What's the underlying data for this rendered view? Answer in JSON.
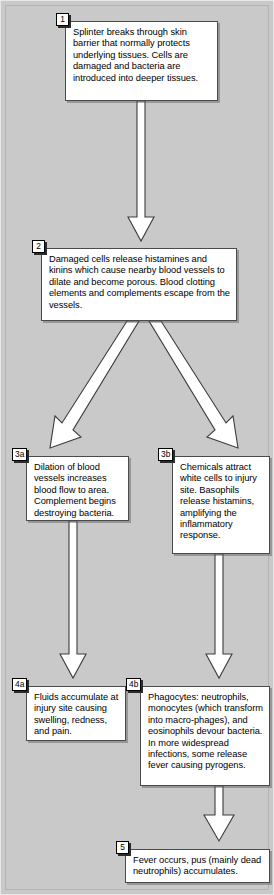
{
  "diagram": {
    "background_color": "#c9c9c9",
    "box_fill": "#ffffff",
    "box_border": "#4a4a4a",
    "arrow_fill": "#ffffff",
    "arrow_stroke": "#3c3c3c",
    "tag_border": "#000000"
  },
  "nodes": [
    {
      "id": "1",
      "tag": "1",
      "text": "Splinter breaks through skin barrier that normally protects underlying tissues.  Cells are damaged and bacteria are introduced into deeper tissues."
    },
    {
      "id": "2",
      "tag": "2",
      "text": "Damaged cells release histamines and kinins which cause nearby blood vessels to dilate and become porous.  Blood clotting elements and complements escape from the vessels."
    },
    {
      "id": "3a",
      "tag": "3a",
      "text": "Dilation of blood vessels increases blood flow to area. Complement begins destroying bacteria."
    },
    {
      "id": "3b",
      "tag": "3b",
      "text": "Chemicals attract white cells to injury site. Basophils release histamins, amplifying the inflammatory response."
    },
    {
      "id": "4a",
      "tag": "4a",
      "text": "Fluids accumulate at injury site causing swelling, redness, and pain."
    },
    {
      "id": "4b",
      "tag": "4b",
      "text": "Phagocytes: neutrophils, monocytes (which transform into macro-phages), and eosinophils devour bacteria. In more widespread infections, some release fever causing pyrogens."
    },
    {
      "id": "5",
      "tag": "5",
      "text": "Fever occurs, pus (mainly dead neutrophils) accumulates."
    }
  ],
  "connectors": [
    {
      "id": "c1",
      "from": "1",
      "to": "2",
      "kind": "vertical-arrow-down"
    },
    {
      "id": "c2",
      "from": "2",
      "to": "3a",
      "kind": "diagonal-arrow-down-left"
    },
    {
      "id": "c3",
      "from": "2",
      "to": "3b",
      "kind": "diagonal-arrow-down-right"
    },
    {
      "id": "c4",
      "from": "3a",
      "to": "4a",
      "kind": "vertical-arrow-down"
    },
    {
      "id": "c5",
      "from": "3b",
      "to": "4b",
      "kind": "vertical-arrow-down"
    },
    {
      "id": "c6",
      "from": "4b",
      "to": "5",
      "kind": "vertical-arrow-down"
    }
  ]
}
